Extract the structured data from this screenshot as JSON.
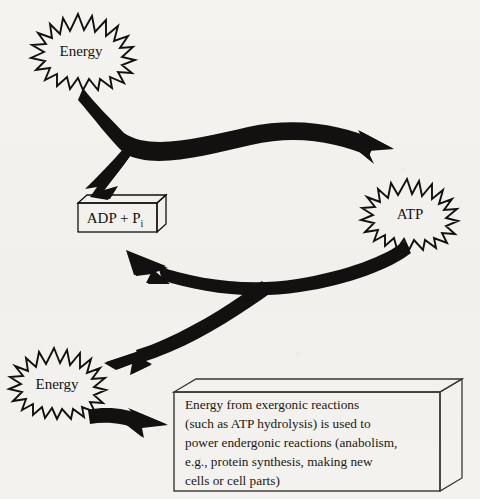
{
  "figure": {
    "background_color": "#f3f2ef",
    "ink_color": "#121110"
  },
  "nodes": {
    "energy_top": {
      "label": "Energy",
      "shape": "starburst"
    },
    "energy_bottom": {
      "label": "Energy",
      "shape": "starburst"
    },
    "atp": {
      "label": "ATP",
      "shape": "starburst"
    },
    "adp": {
      "label_main": "ADP + P",
      "label_sub": "i",
      "shape": "box-3d"
    }
  },
  "caption_box": {
    "shape": "box-3d",
    "lines": [
      "Energy from exergonic reactions",
      "(such as ATP hydrolysis) is used to",
      "power endergonic reactions (anabolism,",
      "e.g., protein synthesis, making new",
      "cells or cell parts)"
    ]
  },
  "arrows": [
    {
      "name": "energy-top-to-atp",
      "from": "energy_top",
      "to": "atp",
      "style": "thick-curved"
    },
    {
      "name": "adp-input",
      "from": "energy_top",
      "to": "adp",
      "style": "branch-arrowhead"
    },
    {
      "name": "atp-to-adp",
      "from": "atp",
      "to": "adp",
      "style": "thick-curved"
    },
    {
      "name": "atp-to-energy-bottom",
      "from": "atp",
      "to": "energy_bottom",
      "style": "branch-curved"
    },
    {
      "name": "energy-bottom-to-caption",
      "from": "energy_bottom",
      "to": "caption_box",
      "style": "thick-short"
    }
  ]
}
